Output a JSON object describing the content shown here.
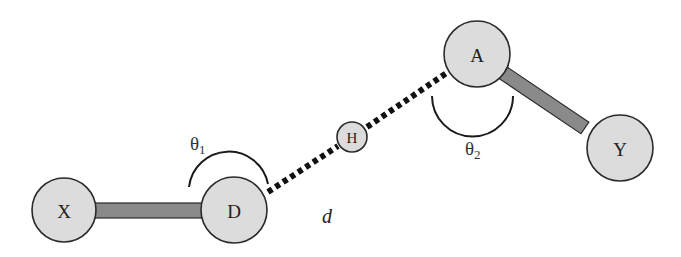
{
  "figure": {
    "type": "hydrogen-bond-geometry",
    "atoms": [
      {
        "id": "X",
        "label": "X"
      },
      {
        "id": "D",
        "label": "D"
      },
      {
        "id": "H",
        "label": "H"
      },
      {
        "id": "A",
        "label": "A"
      },
      {
        "id": "Y",
        "label": "Y"
      }
    ],
    "bonds": [
      {
        "from": "X",
        "to": "D",
        "style": "covalent"
      },
      {
        "from": "A",
        "to": "Y",
        "style": "covalent"
      },
      {
        "from": "D",
        "to": "A",
        "style": "hydrogen-bond-dotted",
        "via": "H"
      }
    ],
    "angles": [
      {
        "id": "theta1",
        "symbol": "θ",
        "subscript": "1",
        "vertex": "D"
      },
      {
        "id": "theta2",
        "symbol": "θ",
        "subscript": "2",
        "vertex": "A"
      }
    ],
    "distance": {
      "symbol": "d"
    },
    "colors": {
      "atom_fill": "#dcdcdc",
      "atom_stroke": "#2a2a2a",
      "bond_fill": "#8a8a8a",
      "hbond": "#111111",
      "background": "#ffffff"
    }
  }
}
